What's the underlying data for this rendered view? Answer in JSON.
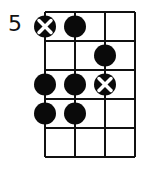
{
  "diagram": {
    "type": "fretboard-chord-diagram",
    "start_fret_label": "5",
    "strings": 4,
    "frets": 5,
    "colors": {
      "line": "#111111",
      "dot": "#0a0a0a",
      "background": "#ffffff",
      "x_mark": "#ffffff"
    },
    "markers": [
      {
        "fret": 1,
        "string": 1,
        "kind": "root-x"
      },
      {
        "fret": 1,
        "string": 2,
        "kind": "dot"
      },
      {
        "fret": 2,
        "string": 3,
        "kind": "dot"
      },
      {
        "fret": 3,
        "string": 1,
        "kind": "dot"
      },
      {
        "fret": 3,
        "string": 2,
        "kind": "dot"
      },
      {
        "fret": 3,
        "string": 3,
        "kind": "root-x"
      },
      {
        "fret": 4,
        "string": 1,
        "kind": "dot"
      },
      {
        "fret": 4,
        "string": 2,
        "kind": "dot"
      }
    ]
  }
}
